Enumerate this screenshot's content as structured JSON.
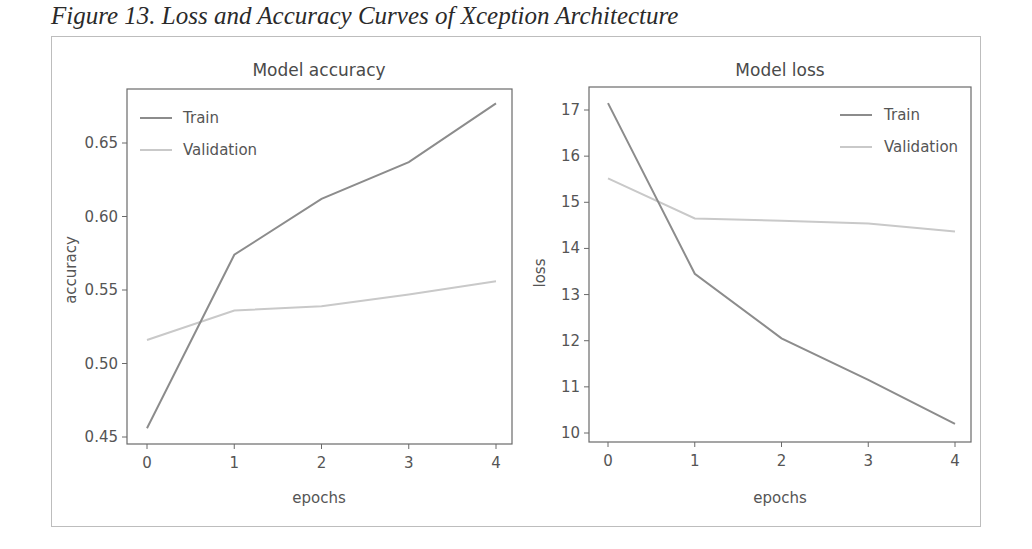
{
  "caption": "Figure 13. Loss and Accuracy Curves of Xception Architecture",
  "colors": {
    "train": "#8c8c8c",
    "validation": "#c9c9c9",
    "axes": "#6a6a6a",
    "frame": "#bdbdbd"
  },
  "legend": {
    "train_label": "Train",
    "validation_label": "Validation"
  },
  "accuracy_chart": {
    "title": "Model accuracy",
    "xlabel": "epochs",
    "ylabel": "accuracy",
    "xticks": [
      "0",
      "1",
      "2",
      "3",
      "4"
    ],
    "yticks": [
      "0.45",
      "0.50",
      "0.55",
      "0.60",
      "0.65"
    ]
  },
  "loss_chart": {
    "title": "Model loss",
    "xlabel": "epochs",
    "ylabel": "loss",
    "xticks": [
      "0",
      "1",
      "2",
      "3",
      "4"
    ],
    "yticks": [
      "10",
      "11",
      "12",
      "13",
      "14",
      "15",
      "16",
      "17"
    ]
  },
  "chart_data": [
    {
      "type": "line",
      "title": "Model accuracy",
      "xlabel": "epochs",
      "ylabel": "accuracy",
      "x": [
        0,
        1,
        2,
        3,
        4
      ],
      "series": [
        {
          "name": "Train",
          "values": [
            0.456,
            0.574,
            0.612,
            0.637,
            0.677
          ]
        },
        {
          "name": "Validation",
          "values": [
            0.516,
            0.536,
            0.539,
            0.547,
            0.556
          ]
        }
      ],
      "xlim": [
        -0.2,
        4.2
      ],
      "ylim": [
        0.446,
        0.683
      ],
      "yticks": [
        0.45,
        0.5,
        0.55,
        0.6,
        0.65
      ],
      "grid": false,
      "legend_position": "upper left"
    },
    {
      "type": "line",
      "title": "Model loss",
      "xlabel": "epochs",
      "ylabel": "loss",
      "x": [
        0,
        1,
        2,
        3,
        4
      ],
      "series": [
        {
          "name": "Train",
          "values": [
            17.15,
            13.45,
            12.05,
            11.15,
            10.2
          ]
        },
        {
          "name": "Validation",
          "values": [
            15.52,
            14.65,
            14.6,
            14.54,
            14.37
          ]
        }
      ],
      "xlim": [
        -0.2,
        4.2
      ],
      "ylim": [
        9.8,
        17.5
      ],
      "yticks": [
        10,
        11,
        12,
        13,
        14,
        15,
        16,
        17
      ],
      "grid": false,
      "legend_position": "upper right"
    }
  ]
}
